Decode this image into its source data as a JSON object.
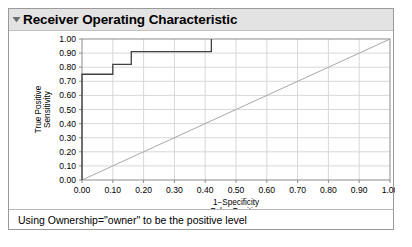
{
  "panel": {
    "title": "Receiver Operating Characteristic",
    "disclosure_icon": "triangle-down-icon",
    "footer_note": "Using Ownership=\"owner\" to be the positive level"
  },
  "colors": {
    "titlebar_bg": "#e3e3e3",
    "panel_border": "#9a9a9a",
    "curve": "#404040",
    "reference_line": "#a8a8a8",
    "grid": "#d8d8d8",
    "frame": "#8c8c8c"
  },
  "chart_data": {
    "type": "line",
    "title": "Receiver Operating Characteristic",
    "xlabel": "1−Specificity",
    "xlabel2": "False Positive",
    "ylabel": "True Positive",
    "ylabel2": "Sensitivity",
    "xlim": [
      0.0,
      1.0
    ],
    "ylim": [
      0.0,
      1.0
    ],
    "grid": true,
    "legend": "none",
    "xticks": [
      "0.00",
      "0.10",
      "0.20",
      "0.30",
      "0.40",
      "0.50",
      "0.60",
      "0.70",
      "0.80",
      "0.90",
      "1.00"
    ],
    "yticks": [
      "0.00",
      "0.10",
      "0.20",
      "0.30",
      "0.40",
      "0.50",
      "0.60",
      "0.70",
      "0.80",
      "0.90",
      "1.00"
    ],
    "xtick_values": [
      0.0,
      0.1,
      0.2,
      0.3,
      0.4,
      0.5,
      0.6,
      0.7,
      0.8,
      0.9,
      1.0
    ],
    "ytick_values": [
      0.0,
      0.1,
      0.2,
      0.3,
      0.4,
      0.5,
      0.6,
      0.7,
      0.8,
      0.9,
      1.0
    ],
    "series": [
      {
        "name": "ROC curve",
        "style": "step",
        "x": [
          0.0,
          0.0,
          0.1,
          0.1,
          0.16,
          0.16,
          0.42,
          0.42
        ],
        "y": [
          0.0,
          0.75,
          0.75,
          0.82,
          0.82,
          0.91,
          0.91,
          1.0
        ]
      },
      {
        "name": "Chance reference line",
        "style": "diagonal",
        "x": [
          0.0,
          1.0
        ],
        "y": [
          0.0,
          1.0
        ]
      }
    ]
  }
}
